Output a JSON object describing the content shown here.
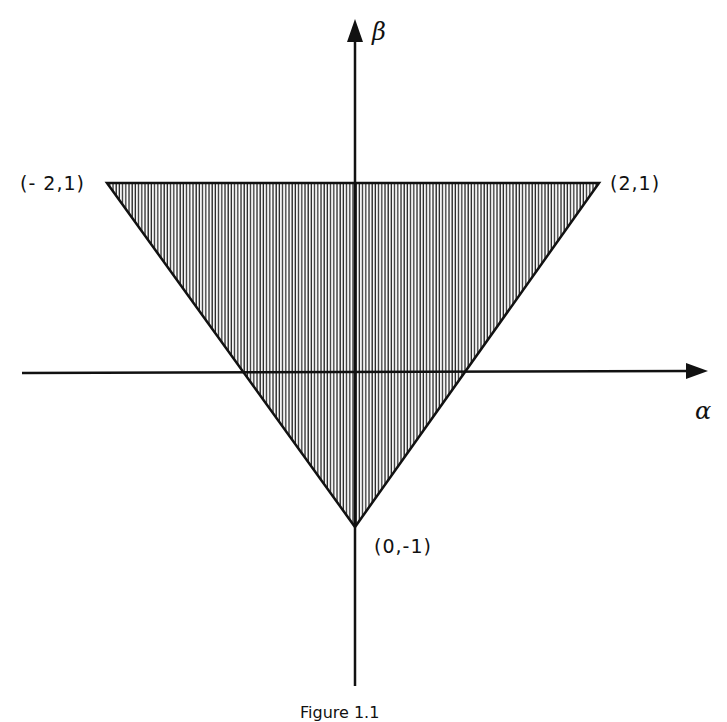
{
  "diagram": {
    "axes": {
      "x_label": "α",
      "y_label": "β"
    },
    "region": {
      "shape": "triangle",
      "fill": "vertical hatching",
      "vertices": [
        {
          "label": "(-2,1)",
          "alpha": -2,
          "beta": 1
        },
        {
          "label": "(2,1)",
          "alpha": 2,
          "beta": 1
        },
        {
          "label": "(0,-1)",
          "alpha": 0,
          "beta": -1
        }
      ]
    },
    "labels": {
      "top_left": "(- 2,1)",
      "top_right": "(2,1)",
      "bottom": "(0,-1)"
    },
    "caption": "Figure 1.1"
  },
  "colors": {
    "ink": "#111111",
    "background": "#ffffff",
    "hatch": "#333333"
  }
}
